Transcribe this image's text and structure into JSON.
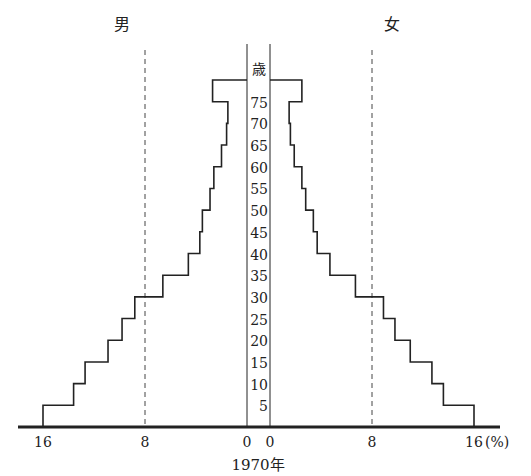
{
  "chart_data": {
    "type": "bar",
    "subtype": "population-pyramid",
    "title": "1970年",
    "left_label": "男",
    "right_label": "女",
    "unit_label": "歳",
    "x_unit": "(%)",
    "xticks_left": [
      "16",
      "8",
      "0"
    ],
    "xticks_right": [
      "0",
      "8",
      "16"
    ],
    "xlim": [
      0,
      16
    ],
    "gridlines": [
      8
    ],
    "age_labels": [
      "5",
      "10",
      "15",
      "20",
      "25",
      "30",
      "35",
      "40",
      "45",
      "50",
      "55",
      "60",
      "65",
      "70",
      "75"
    ],
    "categories": [
      "0-4",
      "5-9",
      "10-14",
      "15-19",
      "20-24",
      "25-29",
      "30-34",
      "35-39",
      "40-44",
      "45-49",
      "50-54",
      "55-59",
      "60-64",
      "65-69",
      "70-74",
      "75+"
    ],
    "series": [
      {
        "name": "男",
        "values": [
          16.0,
          13.6,
          12.7,
          10.9,
          9.8,
          8.8,
          6.6,
          4.6,
          3.7,
          3.5,
          2.9,
          2.6,
          2.0,
          1.6,
          1.5,
          2.7
        ]
      },
      {
        "name": "女",
        "values": [
          16.0,
          13.6,
          12.7,
          11.0,
          9.8,
          8.9,
          6.7,
          4.7,
          3.7,
          3.4,
          2.8,
          2.5,
          1.9,
          1.6,
          1.5,
          2.5
        ]
      }
    ]
  }
}
